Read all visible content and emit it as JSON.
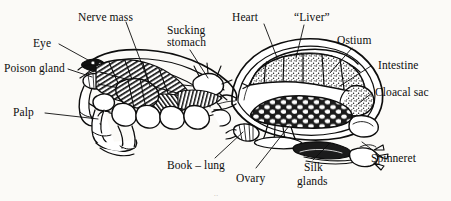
{
  "figure": {
    "background_color": "#fbfaf7",
    "ink_color": "#0d0d0d",
    "width": 451,
    "height": 201,
    "plate_mark": ".."
  },
  "labels": {
    "nerve_mass": "Nerve mass",
    "sucking_stomach_line1": "Sucking",
    "sucking_stomach_line2": "stomach",
    "heart": "Heart",
    "liver": "“Liver”",
    "ostium": "Ostium",
    "intestine": "Intestine",
    "cloacal_sac": "Cloacal sac",
    "eye": "Eye",
    "poison_gland": "Poison gland",
    "palp": "Palp",
    "book_lung": "Book – lung",
    "ovary": "Ovary",
    "silk_glands_line1": "Silk",
    "silk_glands_line2": "glands",
    "spinneret": "Spinneret"
  },
  "parts_list": [
    "Nerve mass",
    "Sucking stomach",
    "Heart",
    "“Liver”",
    "Ostium",
    "Intestine",
    "Cloacal sac",
    "Eye",
    "Poison gland",
    "Palp",
    "Book – lung",
    "Ovary",
    "Silk glands",
    "Spinneret"
  ]
}
